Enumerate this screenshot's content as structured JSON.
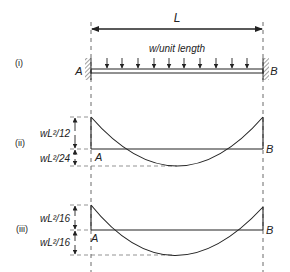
{
  "figure": {
    "span_label": "L",
    "load_label": "w/unit length",
    "support_left": "A",
    "support_right": "B",
    "parts": [
      {
        "id": "i",
        "label": "(i)",
        "description": "Fixed-fixed beam under uniformly distributed load"
      },
      {
        "id": "ii",
        "label": "(ii)",
        "top_dimension": "wL²/12",
        "bottom_dimension": "wL²/24",
        "support_left": "A",
        "support_right": "B",
        "description": "Bending moment diagram, end moment wL²/12, midspan wL²/24"
      },
      {
        "id": "iii",
        "label": "(iii)",
        "top_dimension": "wL²/16",
        "bottom_dimension": "wL²/16",
        "support_left": "A",
        "support_right": "B",
        "description": "Bending moment diagram, end moment wL²/16, midspan wL²/16"
      }
    ],
    "load_arrow_count": 10
  }
}
